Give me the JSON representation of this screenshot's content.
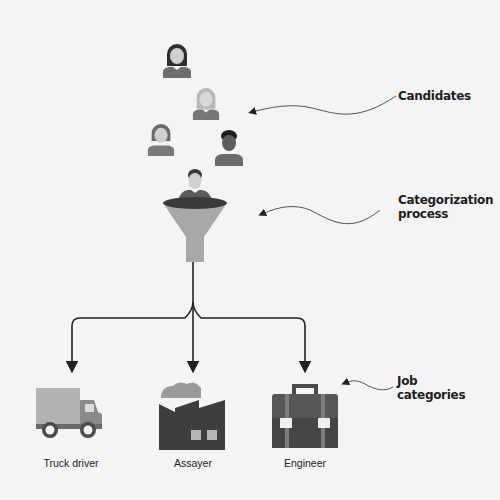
{
  "diagram": {
    "callouts": {
      "candidates": "Candidates",
      "process_line1": "Categorization",
      "process_line2": "process",
      "jobs_line1": "Job",
      "jobs_line2": "categories"
    },
    "candidates": [
      {
        "id": "candidate-1",
        "type": "woman-long-hair",
        "tone": "dark"
      },
      {
        "id": "candidate-2",
        "type": "woman-long-hair",
        "tone": "light"
      },
      {
        "id": "candidate-3",
        "type": "woman-short-hair",
        "tone": "medium"
      },
      {
        "id": "candidate-4",
        "type": "man",
        "tone": "dark"
      },
      {
        "id": "candidate-5",
        "type": "man-in-funnel",
        "tone": "medium"
      }
    ],
    "process_icon": "funnel-icon",
    "job_categories": [
      {
        "label": "Truck driver",
        "icon": "truck-icon"
      },
      {
        "label": "Assayer",
        "icon": "factory-icon"
      },
      {
        "label": "Engineer",
        "icon": "briefcase-icon"
      }
    ],
    "colors": {
      "background": "#f4f4f4",
      "dark": "#4a4a4a",
      "medium": "#7a7a7a",
      "light": "#b5b5b5",
      "skin": "#d6d6d6",
      "line": "#222222"
    }
  }
}
